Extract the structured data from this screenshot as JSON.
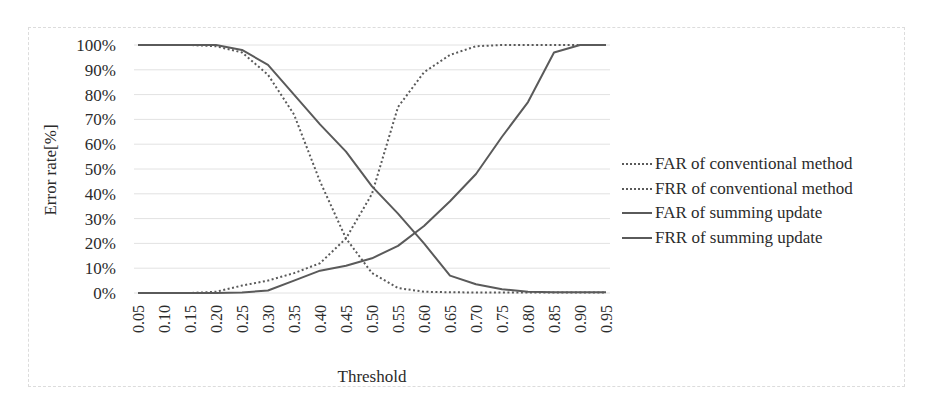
{
  "chart_data": {
    "type": "line",
    "title": "",
    "xlabel": "Threshold",
    "ylabel": "Error rate[%]",
    "ylim": [
      0,
      100
    ],
    "grid": true,
    "legend_position": "right",
    "x": [
      0.05,
      0.1,
      0.15,
      0.2,
      0.25,
      0.3,
      0.35,
      0.4,
      0.45,
      0.5,
      0.55,
      0.6,
      0.65,
      0.7,
      0.75,
      0.8,
      0.85,
      0.9,
      0.95
    ],
    "x_tick_labels": [
      "0.05",
      "0.10",
      "0.15",
      "0.20",
      "0.25",
      "0.30",
      "0.35",
      "0.40",
      "0.45",
      "0.50",
      "0.55",
      "0.60",
      "0.65",
      "0.70",
      "0.75",
      "0.80",
      "0.85",
      "0.90",
      "0.95"
    ],
    "y_tick_labels": [
      "0%",
      "10%",
      "20%",
      "30%",
      "40%",
      "50%",
      "60%",
      "70%",
      "80%",
      "90%",
      "100%"
    ],
    "series": [
      {
        "name": "FAR of conventional method",
        "style": "dotted",
        "values": [
          100,
          100,
          100,
          99.5,
          97,
          88,
          72,
          45,
          22,
          8,
          2,
          0.5,
          0.3,
          0.2,
          0.2,
          0.2,
          0.2,
          0.2,
          0.2
        ]
      },
      {
        "name": "FRR of conventional method",
        "style": "dotted",
        "values": [
          0,
          0,
          0,
          0.5,
          3,
          5,
          8,
          12,
          22,
          40,
          75,
          89,
          96,
          99.5,
          100,
          100,
          100,
          100,
          100
        ]
      },
      {
        "name": "FAR of summing update",
        "style": "solid",
        "values": [
          100,
          100,
          100,
          100,
          98,
          92,
          80,
          68,
          57,
          43,
          32,
          20,
          7,
          3.5,
          1.5,
          0.5,
          0.3,
          0.3,
          0.3
        ]
      },
      {
        "name": "FRR of summing update",
        "style": "solid",
        "values": [
          0,
          0,
          0,
          0,
          0.2,
          1,
          5,
          9,
          11,
          14,
          19,
          27,
          37,
          48,
          63,
          77,
          97,
          100,
          100
        ]
      }
    ]
  },
  "legend": {
    "items": [
      {
        "label": "FAR of conventional method",
        "style": "dotted"
      },
      {
        "label": "FRR of conventional method",
        "style": "dotted"
      },
      {
        "label": "FAR of summing update",
        "style": "solid"
      },
      {
        "label": "FRR of summing update",
        "style": "solid"
      }
    ]
  },
  "colors": {
    "line": "#5a5a5a",
    "grid": "#e2e2e2",
    "text": "#2b2b2b"
  }
}
